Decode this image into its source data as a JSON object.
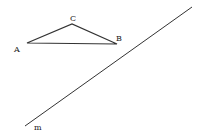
{
  "diagram": {
    "type": "geometry",
    "points": {
      "A": {
        "label": "A",
        "x": 27,
        "y": 43,
        "label_x": 14,
        "label_y": 52
      },
      "B": {
        "label": "B",
        "x": 117,
        "y": 44,
        "label_x": 116,
        "label_y": 41
      },
      "C": {
        "label": "C",
        "x": 72,
        "y": 24,
        "label_x": 70,
        "label_y": 21
      }
    },
    "triangle": [
      "A",
      "B",
      "C"
    ],
    "line_m": {
      "label": "m",
      "x1": 25,
      "y1": 126,
      "x2": 192,
      "y2": 7,
      "label_x": 34,
      "label_y": 130
    },
    "colors": {
      "stroke": "#333333",
      "background": "#ffffff"
    }
  }
}
